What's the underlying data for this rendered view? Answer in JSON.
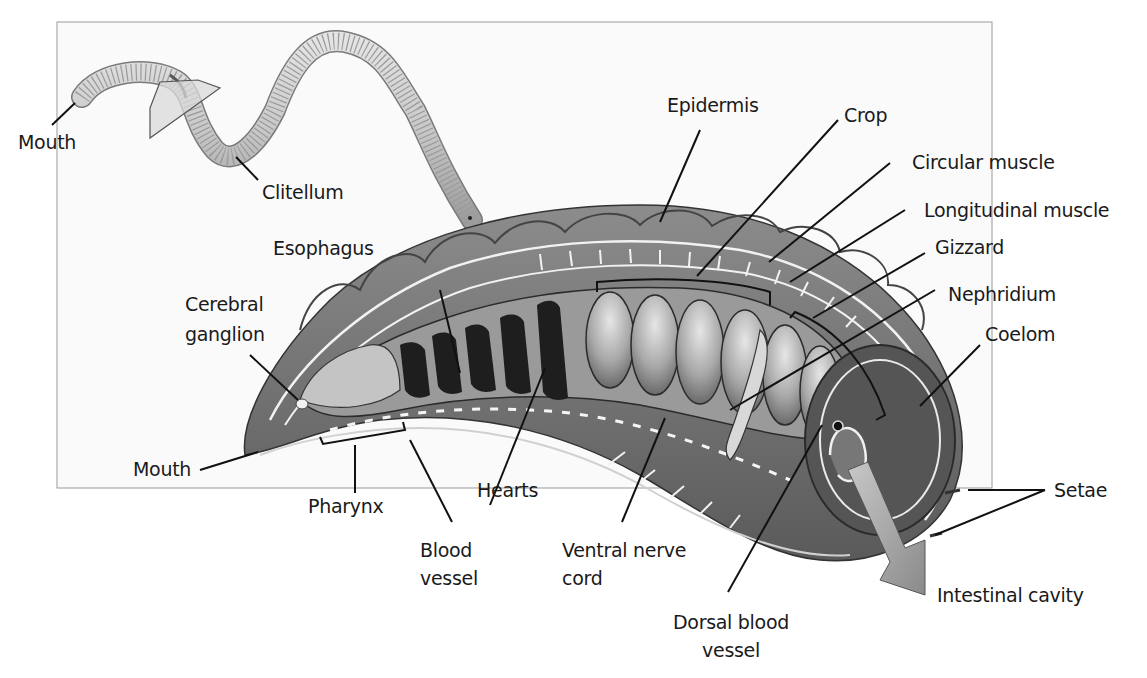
{
  "figure": {
    "frame_color": "#9a9a9a",
    "body_color_dark": "#4a4a4a",
    "body_color_mid": "#7a7a7a",
    "body_color_light": "#bdbdbd"
  },
  "labels": {
    "mouth_top": "Mouth",
    "clitellum": "Clitellum",
    "epidermis": "Epidermis",
    "crop": "Crop",
    "circular_muscle": "Circular muscle",
    "longitudinal_muscle": "Longitudinal muscle",
    "gizzard": "Gizzard",
    "nephridium": "Nephridium",
    "coelom": "Coelom",
    "esophagus": "Esophagus",
    "cerebral_ganglion_1": "Cerebral",
    "cerebral_ganglion_2": "ganglion",
    "mouth_bottom": "Mouth",
    "pharynx": "Pharynx",
    "hearts": "Hearts",
    "blood_vessel_1": "Blood",
    "blood_vessel_2": "vessel",
    "ventral_nerve_cord_1": "Ventral nerve",
    "ventral_nerve_cord_2": "cord",
    "dorsal_blood_vessel_1": "Dorsal blood",
    "dorsal_blood_vessel_2": "vessel",
    "setae": "Setae",
    "intestinal_cavity": "Intestinal cavity"
  }
}
